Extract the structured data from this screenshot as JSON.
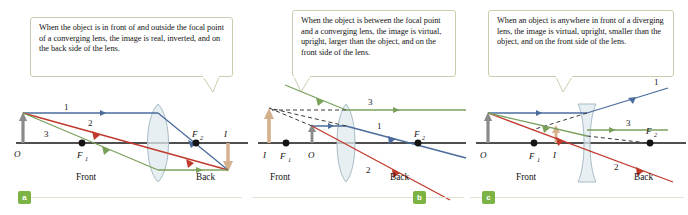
{
  "figure": {
    "panels": [
      {
        "id": "a",
        "badge": "a",
        "caption": "When the object is in front of and outside the focal point of a converging lens, the image is real, inverted, and on the back side of the lens.",
        "lens_type": "converging",
        "labels": {
          "object": "O",
          "image": "I",
          "focal_front": "F",
          "focal_front_sub": "1",
          "focal_back": "F",
          "focal_back_sub": "2",
          "front": "Front",
          "back": "Back"
        },
        "rays": [
          "1",
          "2",
          "3"
        ]
      },
      {
        "id": "b",
        "badge": "b",
        "caption": "When the object is between the focal point and a converging lens, the image is virtual, upright, larger than the object, and on the front side of the lens.",
        "lens_type": "converging",
        "labels": {
          "object": "O",
          "image": "I",
          "focal_front": "F",
          "focal_front_sub": "1",
          "focal_back": "F",
          "focal_back_sub": "2",
          "front": "Front",
          "back": "Back"
        },
        "rays": [
          "1",
          "2",
          "3"
        ]
      },
      {
        "id": "c",
        "badge": "c",
        "caption": "When an object is anywhere in front of a diverging lens, the image is virtual, upright, smaller than the object, and on the front side of the lens.",
        "lens_type": "diverging",
        "labels": {
          "object": "O",
          "image": "I",
          "focal_front": "F",
          "focal_front_sub": "1",
          "focal_back": "F",
          "focal_back_sub": "2",
          "front": "Front",
          "back": "Back"
        },
        "rays": [
          "1",
          "2",
          "3"
        ]
      }
    ],
    "colors": {
      "ray1": "#4a6b9c",
      "ray2": "#c0392b",
      "ray3": "#7ba05b",
      "axis": "#141414",
      "object_arrow": "#8a8a8a",
      "image_arrow": "#d4b08c",
      "lens_fill": "#dfe9ee",
      "lens_stroke": "#a8bcc6",
      "callout_border": "#c9cfae",
      "badge": "#7cb342",
      "rule": "#dfe3d2"
    }
  }
}
